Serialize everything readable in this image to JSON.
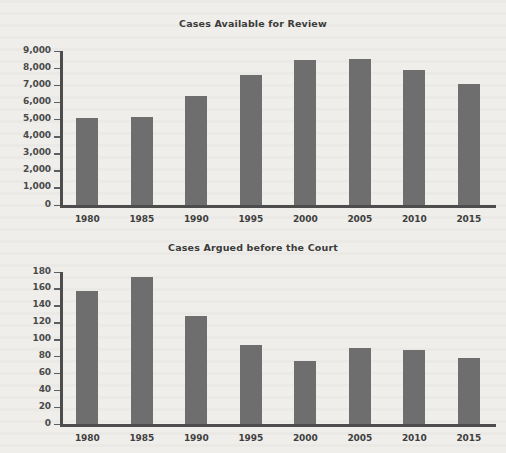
{
  "chart_data": [
    {
      "type": "bar",
      "title": "Cases Available for Review",
      "xlabel": "",
      "ylabel": "",
      "categories": [
        "1980",
        "1985",
        "1990",
        "1995",
        "2000",
        "2005",
        "2010",
        "2015"
      ],
      "values": [
        5100,
        5150,
        6350,
        7600,
        8480,
        8550,
        7900,
        7080
      ],
      "yticks": [
        "0",
        "1,000",
        "2,000",
        "3,000",
        "4,000",
        "5,000",
        "6,000",
        "7,000",
        "8,000",
        "9,000"
      ],
      "ytick_values": [
        0,
        1000,
        2000,
        3000,
        4000,
        5000,
        6000,
        7000,
        8000,
        9000
      ],
      "ylim": [
        0,
        9000
      ],
      "grid": false,
      "legend": "none",
      "bar_color": "#6e6e6e",
      "axis_color": "#4d4d4d"
    },
    {
      "type": "bar",
      "title": "Cases Argued before the Court",
      "xlabel": "",
      "ylabel": "",
      "categories": [
        "1980",
        "1985",
        "1990",
        "1995",
        "2000",
        "2005",
        "2010",
        "2015"
      ],
      "values": [
        157,
        174,
        128,
        93,
        75,
        90,
        88,
        78
      ],
      "yticks": [
        "0",
        "20",
        "40",
        "60",
        "80",
        "100",
        "120",
        "140",
        "160",
        "180"
      ],
      "ytick_values": [
        0,
        20,
        40,
        60,
        80,
        100,
        120,
        140,
        160,
        180
      ],
      "ylim": [
        0,
        180
      ],
      "grid": false,
      "legend": "none",
      "bar_color": "#6e6e6e",
      "axis_color": "#4d4d4d"
    }
  ],
  "page": {
    "background_color": "#efeeea"
  }
}
